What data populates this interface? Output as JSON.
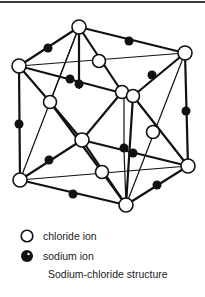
{
  "figure": {
    "title": "Sodium-chloride structure",
    "legend": [
      {
        "symbol": "open-circle",
        "label": "chloride ion"
      },
      {
        "symbol": "filled-circle",
        "label": "sodium ion"
      }
    ],
    "chloride_ions": [
      [
        79,
        27
      ],
      [
        19,
        66
      ],
      [
        185,
        53
      ],
      [
        99,
        61
      ],
      [
        122,
        92
      ],
      [
        133,
        96
      ],
      [
        50,
        102
      ],
      [
        82,
        140
      ],
      [
        153,
        132
      ],
      [
        20,
        180
      ],
      [
        102,
        172
      ],
      [
        188,
        166
      ],
      [
        126,
        205
      ]
    ],
    "sodium_ions": [
      [
        48,
        48
      ],
      [
        129,
        41
      ],
      [
        70,
        79
      ],
      [
        79,
        84
      ],
      [
        152,
        75
      ],
      [
        19,
        124
      ],
      [
        186,
        111
      ],
      [
        124,
        148
      ],
      [
        133,
        153
      ],
      [
        49,
        160
      ],
      [
        73,
        194
      ],
      [
        157,
        185
      ]
    ],
    "colors": {
      "line": "#111111",
      "sodium": "#111111",
      "chloride_fill": "#ffffff"
    }
  }
}
